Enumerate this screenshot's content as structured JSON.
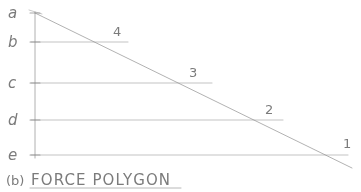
{
  "figure": {
    "caption_prefix": "(b)",
    "caption_text": "FORCE POLYGON",
    "caption_underlined": true,
    "medium": "pencil sketch on white paper",
    "ink_color": "#8a8a8a",
    "paper_color": "#ffffff"
  },
  "load_line": {
    "name": "vertical load line",
    "axis_x": 35,
    "top_y": 12,
    "bottom_y": 158,
    "points": [
      {
        "label": "a",
        "y": 13
      },
      {
        "label": "b",
        "y": 42
      },
      {
        "label": "c",
        "y": 83
      },
      {
        "label": "d",
        "y": 120
      },
      {
        "label": "e",
        "y": 155
      }
    ]
  },
  "rays": {
    "pole_ray_label": "inclined ray line from a to 1",
    "start": {
      "x": 35,
      "y": 13
    },
    "end": {
      "x": 352,
      "y": 168
    },
    "items": [
      {
        "number": "4",
        "from_label": "b",
        "y": 42,
        "end_x": 128,
        "num_x": 113,
        "num_y": 36
      },
      {
        "number": "3",
        "from_label": "c",
        "y": 83,
        "end_x": 212,
        "num_x": 189,
        "num_y": 77
      },
      {
        "number": "2",
        "from_label": "d",
        "y": 120,
        "end_x": 283,
        "num_x": 265,
        "num_y": 114
      },
      {
        "number": "1",
        "from_label": "e",
        "y": 155,
        "end_x": 348,
        "num_x": 343,
        "num_y": 148
      }
    ]
  },
  "underline": {
    "x1": 30,
    "x2": 181,
    "y": 188
  }
}
